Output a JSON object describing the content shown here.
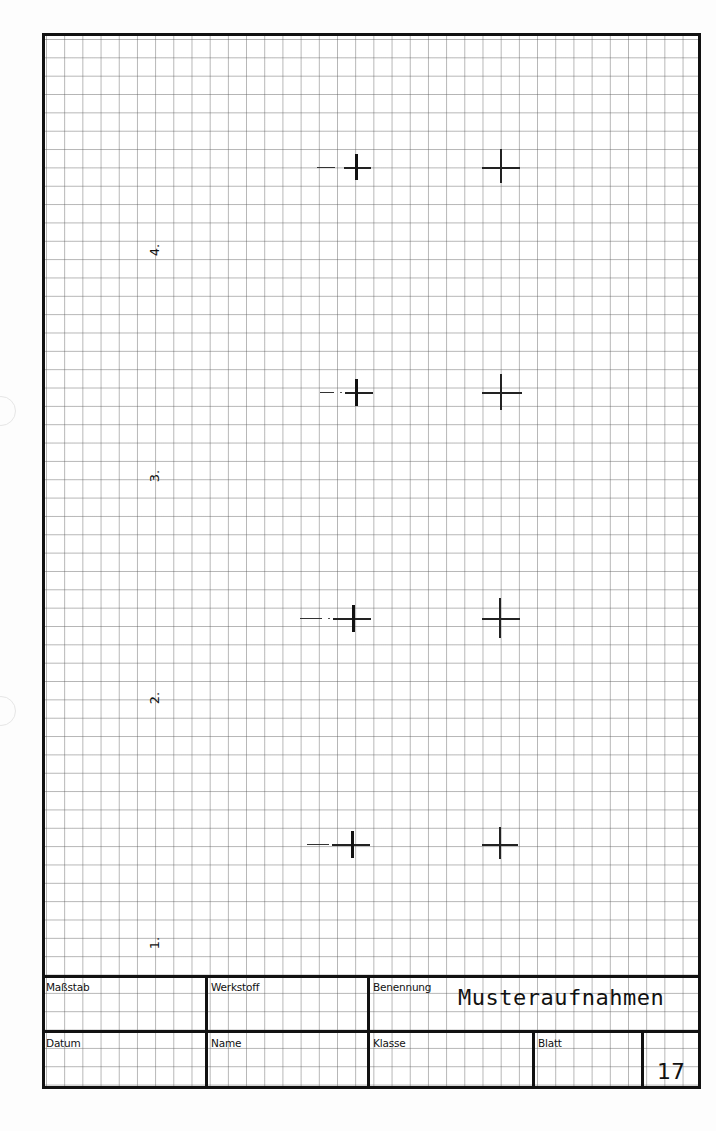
{
  "sheet": {
    "grid_color": "#5a5a5a",
    "border_color": "#111111"
  },
  "row_labels": [
    "4.",
    "3.",
    "2.",
    "1."
  ],
  "marks": [
    {
      "row": "4",
      "left_cross": "bold",
      "right_cross": "thin"
    },
    {
      "row": "3",
      "left_cross": "bold",
      "right_cross": "thin"
    },
    {
      "row": "2",
      "left_cross": "bold",
      "right_cross": "thin"
    },
    {
      "row": "1",
      "left_cross": "bold",
      "right_cross": "thin"
    }
  ],
  "title_block": {
    "scale_label": "Maßstab",
    "scale_value": "",
    "material_label": "Werkstoff",
    "material_value": "",
    "designation_label": "Benennung",
    "designation_value": "Musteraufnahmen",
    "date_label": "Datum",
    "date_value": "",
    "name_label": "Name",
    "name_value": "",
    "class_label": "Klasse",
    "class_value": "",
    "sheet_label": "Blatt",
    "sheet_number": "17"
  }
}
